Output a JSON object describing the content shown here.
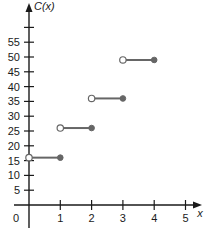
{
  "chart_data": {
    "type": "line",
    "subtype": "step-function",
    "title": "",
    "xlabel": "x",
    "ylabel": "C(x)",
    "xlim": [
      0,
      5.5
    ],
    "ylim": [
      0,
      62
    ],
    "x_ticks": [
      1,
      2,
      3,
      4,
      5
    ],
    "x_tick_labels": [
      "0",
      "1",
      "2",
      "3",
      "4",
      "5"
    ],
    "y_ticks": [
      5,
      10,
      15,
      20,
      25,
      30,
      35,
      40,
      45,
      50,
      55,
      60
    ],
    "y_tick_labels": [
      "5",
      "10",
      "15",
      "20",
      "25",
      "30",
      "35",
      "40",
      "45",
      "50",
      "55",
      ""
    ],
    "grid": false,
    "legend": null,
    "segments": [
      {
        "x_start": 0,
        "x_end": 1,
        "y": 16,
        "start": "open",
        "end": "closed"
      },
      {
        "x_start": 1,
        "x_end": 2,
        "y": 26,
        "start": "open",
        "end": "closed"
      },
      {
        "x_start": 2,
        "x_end": 3,
        "y": 36,
        "start": "open",
        "end": "closed"
      },
      {
        "x_start": 3,
        "x_end": 4,
        "y": 49,
        "start": "open",
        "end": "closed"
      }
    ],
    "colors": {
      "axis": "#1a1a1a",
      "segment": "#666666",
      "dot_fill": "#666666",
      "open_fill": "#ffffff"
    }
  }
}
